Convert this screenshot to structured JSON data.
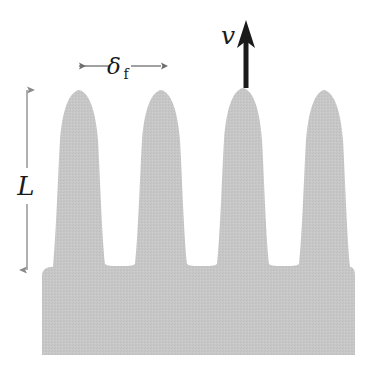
{
  "figure": {
    "background_color": "#ffffff",
    "width": 381,
    "height": 380
  },
  "shape": {
    "name": "flame-front-region",
    "fill_color": "#c5c5c5",
    "texture": "fine stippled / halftone gray",
    "finger_count": 4,
    "base": {
      "left_x": 42,
      "right_x": 355,
      "top_y": 267,
      "bottom_y": 355
    },
    "fingers": [
      {
        "index": 1,
        "tip_x": 79,
        "tip_y": 90,
        "half_width": 26
      },
      {
        "index": 2,
        "tip_x": 161,
        "tip_y": 90,
        "half_width": 26
      },
      {
        "index": 3,
        "tip_x": 243,
        "tip_y": 88,
        "half_width": 29
      },
      {
        "index": 4,
        "tip_x": 324,
        "tip_y": 90,
        "half_width": 26
      }
    ],
    "valleys": [
      {
        "center_x": 120,
        "bottom_y": 266
      },
      {
        "center_x": 202,
        "bottom_y": 266
      },
      {
        "center_x": 284,
        "bottom_y": 266
      }
    ]
  },
  "annotations": {
    "length_label": {
      "symbol": "L",
      "description": "overall flame brush length",
      "arrow": {
        "x": 27,
        "y_top": 88,
        "y_bottom": 272,
        "double_headed": true,
        "color": "#7a7a7a"
      },
      "text_x": 25,
      "text_y": 186,
      "font_size": 26
    },
    "thickness_label": {
      "symbol": "δ",
      "subscript": "f",
      "description": "laminar flame thickness",
      "arrow": {
        "y": 66,
        "x_left": 78,
        "x_right": 162,
        "double_headed": true,
        "color": "#6e6e6e"
      },
      "text_x": 120,
      "text_y": 74,
      "font_size": 22,
      "subscript_font_size": 14
    },
    "velocity_label": {
      "symbol": "v",
      "description": "flame propagation velocity",
      "arrow": {
        "x": 246,
        "y_top": 21,
        "y_bottom": 88,
        "head_only_top": true,
        "color": "#1a1a1a",
        "shaft_width": 5
      },
      "text_x": 228,
      "text_y": 42,
      "font_size": 25
    }
  },
  "colors": {
    "flame_gray": "#c5c5c5",
    "annotation_gray": "#757575",
    "ink_black": "#1a1a1a",
    "page_white": "#ffffff"
  }
}
